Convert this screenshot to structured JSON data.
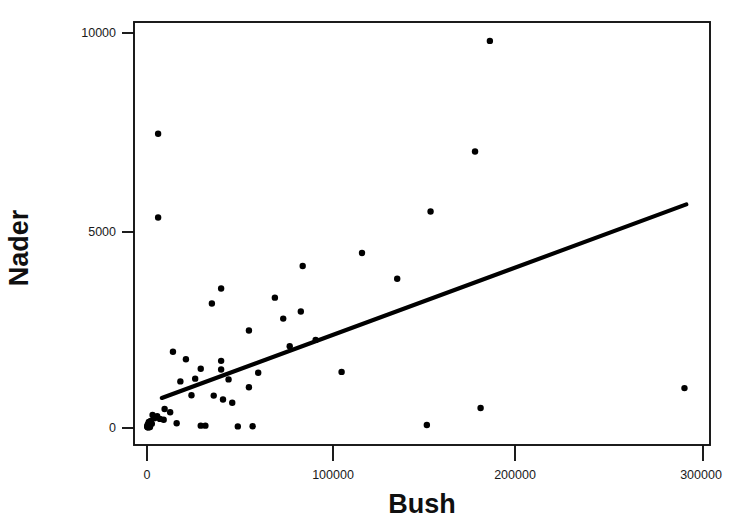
{
  "chart_data": {
    "type": "scatter",
    "title": "",
    "xlabel": "Bush",
    "ylabel": "Nader",
    "xlim": [
      -15000,
      312000
    ],
    "ylim": [
      -700,
      10600
    ],
    "grid": false,
    "legend": null,
    "xticks": [
      0,
      100000,
      200000,
      300000
    ],
    "xtick_labels": [
      "0",
      "100000",
      "200000",
      "300000"
    ],
    "yticks": [
      0,
      5000,
      10000
    ],
    "ytick_labels": [
      "0",
      "5000",
      "10000"
    ],
    "marker": "filled-circle",
    "marker_color": "#000000",
    "points": [
      {
        "x": 185000,
        "y": 9800
      },
      {
        "x": 6000,
        "y": 7450
      },
      {
        "x": 177000,
        "y": 7000
      },
      {
        "x": 6000,
        "y": 5330
      },
      {
        "x": 153000,
        "y": 5480
      },
      {
        "x": 116000,
        "y": 4430
      },
      {
        "x": 84000,
        "y": 4100
      },
      {
        "x": 135000,
        "y": 3780
      },
      {
        "x": 40000,
        "y": 3530
      },
      {
        "x": 69000,
        "y": 3300
      },
      {
        "x": 35000,
        "y": 3150
      },
      {
        "x": 83000,
        "y": 2950
      },
      {
        "x": 73500,
        "y": 2770
      },
      {
        "x": 55000,
        "y": 2470
      },
      {
        "x": 91000,
        "y": 2230
      },
      {
        "x": 77000,
        "y": 2070
      },
      {
        "x": 14000,
        "y": 1930
      },
      {
        "x": 21000,
        "y": 1740
      },
      {
        "x": 40000,
        "y": 1700
      },
      {
        "x": 29000,
        "y": 1500
      },
      {
        "x": 40000,
        "y": 1480
      },
      {
        "x": 105000,
        "y": 1420
      },
      {
        "x": 60000,
        "y": 1400
      },
      {
        "x": 26000,
        "y": 1250
      },
      {
        "x": 44000,
        "y": 1230
      },
      {
        "x": 18000,
        "y": 1180
      },
      {
        "x": 55000,
        "y": 1030
      },
      {
        "x": 290000,
        "y": 1010
      },
      {
        "x": 24000,
        "y": 830
      },
      {
        "x": 36000,
        "y": 820
      },
      {
        "x": 41000,
        "y": 720
      },
      {
        "x": 46000,
        "y": 640
      },
      {
        "x": 180000,
        "y": 505
      },
      {
        "x": 9500,
        "y": 480
      },
      {
        "x": 12500,
        "y": 400
      },
      {
        "x": 3000,
        "y": 330
      },
      {
        "x": 5500,
        "y": 300
      },
      {
        "x": 4000,
        "y": 250
      },
      {
        "x": 7000,
        "y": 230
      },
      {
        "x": 9000,
        "y": 210
      },
      {
        "x": 2000,
        "y": 180
      },
      {
        "x": 1000,
        "y": 150
      },
      {
        "x": 1500,
        "y": 120
      },
      {
        "x": 2600,
        "y": 110
      },
      {
        "x": 500,
        "y": 95
      },
      {
        "x": 900,
        "y": 80
      },
      {
        "x": 1300,
        "y": 70
      },
      {
        "x": 200,
        "y": 60
      },
      {
        "x": 600,
        "y": 50
      },
      {
        "x": 1100,
        "y": 40
      },
      {
        "x": 100,
        "y": 30
      },
      {
        "x": 400,
        "y": 20
      },
      {
        "x": 800,
        "y": 15
      },
      {
        "x": 1600,
        "y": 25
      },
      {
        "x": 16000,
        "y": 120
      },
      {
        "x": 29000,
        "y": 60
      },
      {
        "x": 31500,
        "y": 60
      },
      {
        "x": 49000,
        "y": 40
      },
      {
        "x": 57000,
        "y": 45
      },
      {
        "x": 151000,
        "y": 75
      }
    ],
    "fit_line": {
      "label": "linear regression line",
      "x_start": 8000,
      "y_start": 760,
      "x_end": 291000,
      "y_end": 5660
    }
  },
  "axes": {
    "y_axis_label": "Nader",
    "x_axis_label": "Bush"
  }
}
